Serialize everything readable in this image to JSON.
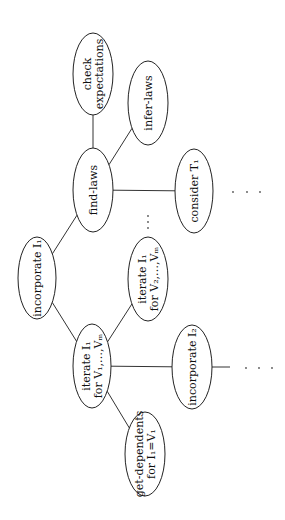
{
  "diagram": {
    "type": "tree",
    "orientation": "rotated-90-ccw",
    "nodes": [
      {
        "id": "check-expectations",
        "lines": [
          "check",
          "expectations"
        ]
      },
      {
        "id": "infer-laws",
        "lines": [
          "infer-laws"
        ]
      },
      {
        "id": "find-laws",
        "lines": [
          "find-laws"
        ]
      },
      {
        "id": "consider-t1",
        "lines": [
          "consider T₁"
        ]
      },
      {
        "id": "incorporate-i1",
        "lines": [
          "incorporate I₁"
        ]
      },
      {
        "id": "iterate-i1-v2",
        "lines": [
          "iterate I₁",
          "for V₂,…,Vₘ"
        ]
      },
      {
        "id": "iterate-i1-v1",
        "lines": [
          "iterate I₁",
          "for V₁,…,Vₘ"
        ]
      },
      {
        "id": "incorporate-i2",
        "lines": [
          "incorporate I₂"
        ]
      },
      {
        "id": "get-dependents",
        "lines": [
          "get-dependents",
          "for I₁=V₁"
        ]
      }
    ],
    "edges": [
      [
        "find-laws",
        "check-expectations"
      ],
      [
        "find-laws",
        "infer-laws"
      ],
      [
        "find-laws",
        "consider-t1"
      ],
      [
        "find-laws",
        "incorporate-i1"
      ],
      [
        "incorporate-i1",
        "iterate-i1-v1"
      ],
      [
        "iterate-i1-v1",
        "iterate-i1-v2"
      ],
      [
        "iterate-i1-v1",
        "incorporate-i2"
      ],
      [
        "iterate-i1-v1",
        "get-dependents"
      ]
    ],
    "ellipsis": "⋯"
  }
}
